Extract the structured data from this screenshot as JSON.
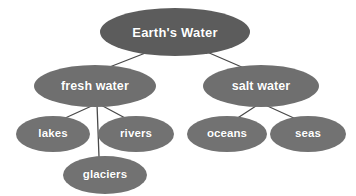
{
  "diagram": {
    "type": "tree",
    "title": "Earth's Water",
    "background_color": "#ffffff",
    "root_color": "#5c5c5c",
    "branch_color": "#6f6f6f",
    "leaf_color": "#727272",
    "text_color": "#ffffff",
    "connector_color": "#4a4a4a",
    "nodes": {
      "root": {
        "label": "Earth's Water",
        "level": 1,
        "cx": 175,
        "cy": 32,
        "rx": 75,
        "ry": 24
      },
      "fresh_water": {
        "label": "fresh water",
        "level": 2,
        "cx": 95,
        "cy": 86,
        "rx": 61,
        "ry": 21
      },
      "salt_water": {
        "label": "salt water",
        "level": 2,
        "cx": 261,
        "cy": 86,
        "rx": 58,
        "ry": 21
      },
      "lakes": {
        "label": "lakes",
        "level": 3,
        "cx": 53,
        "cy": 134,
        "rx": 37,
        "ry": 18
      },
      "rivers": {
        "label": "rivers",
        "level": 3,
        "cx": 136,
        "cy": 134,
        "rx": 38,
        "ry": 18
      },
      "glaciers": {
        "label": "glaciers",
        "level": 4,
        "cx": 105,
        "cy": 175,
        "rx": 42,
        "ry": 19
      },
      "oceans": {
        "label": "oceans",
        "level": 3,
        "cx": 227,
        "cy": 134,
        "rx": 40,
        "ry": 18
      },
      "seas": {
        "label": "seas",
        "level": 3,
        "cx": 308,
        "cy": 134,
        "rx": 38,
        "ry": 18
      }
    },
    "edges": [
      {
        "from": "root",
        "to": "fresh_water",
        "x1": 148,
        "y1": 52,
        "x2": 107,
        "y2": 68
      },
      {
        "from": "root",
        "to": "salt_water",
        "x1": 207,
        "y1": 52,
        "x2": 244,
        "y2": 68
      },
      {
        "from": "fresh_water",
        "to": "lakes",
        "x1": 96,
        "y1": 104,
        "x2": 63,
        "y2": 119
      },
      {
        "from": "fresh_water",
        "to": "glaciers",
        "x1": 97,
        "y1": 104,
        "x2": 99,
        "y2": 157
      },
      {
        "from": "fresh_water",
        "to": "rivers",
        "x1": 99,
        "y1": 104,
        "x2": 127,
        "y2": 119
      },
      {
        "from": "salt_water",
        "to": "oceans",
        "x1": 259,
        "y1": 104,
        "x2": 236,
        "y2": 119
      },
      {
        "from": "salt_water",
        "to": "seas",
        "x1": 263,
        "y1": 104,
        "x2": 296,
        "y2": 119
      }
    ]
  }
}
